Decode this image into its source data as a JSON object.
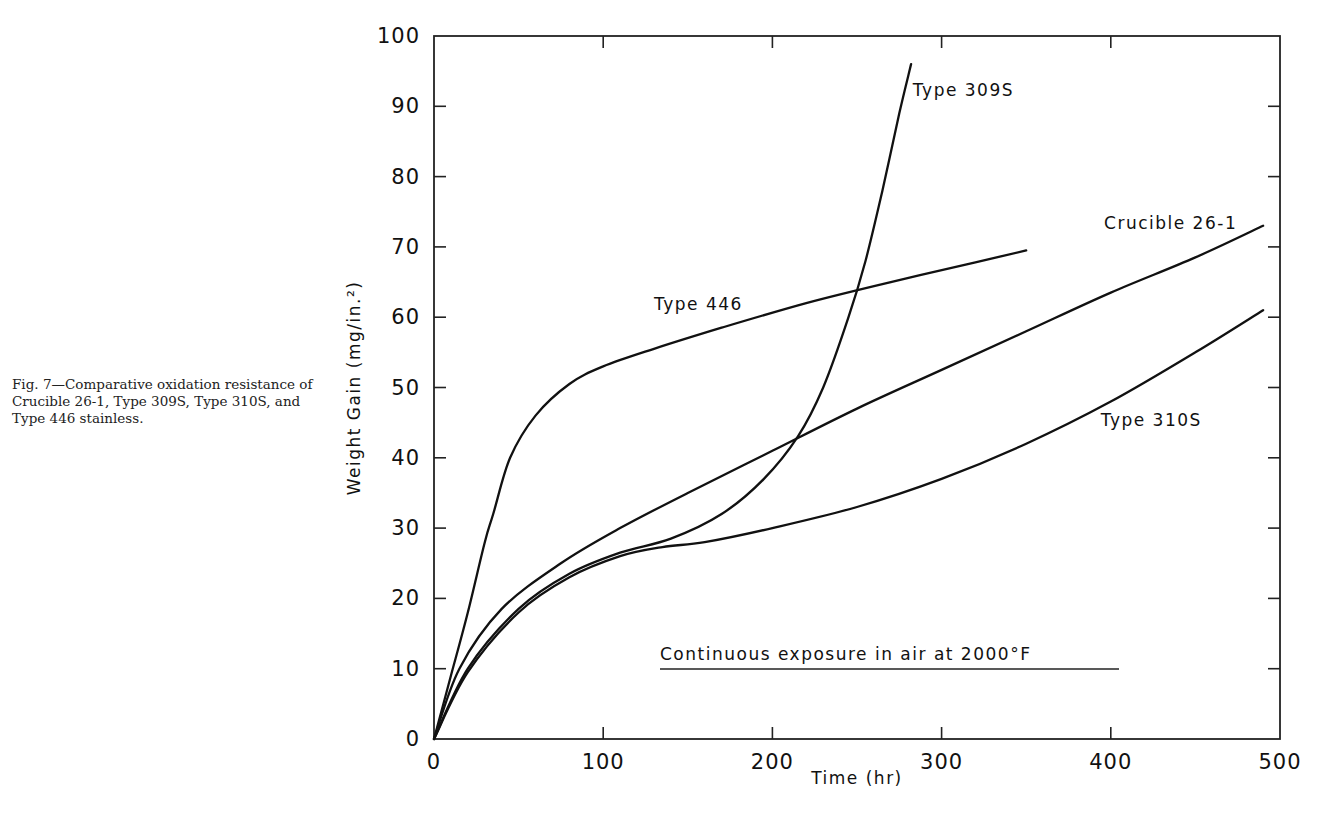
{
  "caption": "Fig. 7—Comparative oxidation resistance of Crucible 26-1, Type 309S, Type 310S, and Type 446 stainless.",
  "chart_data": {
    "type": "line",
    "title": "",
    "xlabel": "Time (hr)",
    "ylabel": "Weight Gain (mg/in.²)",
    "xlim": [
      0,
      500
    ],
    "ylim": [
      0,
      100
    ],
    "x_ticks": [
      0,
      100,
      200,
      300,
      400,
      500
    ],
    "y_ticks": [
      0,
      10,
      20,
      30,
      40,
      50,
      60,
      70,
      80,
      90,
      100
    ],
    "grid": false,
    "legend": "inline labels",
    "annotation": "Continuous exposure in air at 2000°F",
    "series": [
      {
        "name": "Type 446",
        "label_pos": [
          130,
          61
        ],
        "points": [
          [
            0,
            0
          ],
          [
            10,
            9
          ],
          [
            20,
            18
          ],
          [
            30,
            28
          ],
          [
            35,
            32
          ],
          [
            45,
            40
          ],
          [
            60,
            46
          ],
          [
            80,
            50.5
          ],
          [
            100,
            53
          ],
          [
            130,
            55.5
          ],
          [
            170,
            58.5
          ],
          [
            220,
            62
          ],
          [
            270,
            65
          ],
          [
            320,
            67.8
          ],
          [
            350,
            69.5
          ]
        ]
      },
      {
        "name": "Type 309S",
        "label_pos": [
          283,
          91.5
        ],
        "points": [
          [
            0,
            0
          ],
          [
            20,
            10
          ],
          [
            50,
            18.5
          ],
          [
            80,
            23.5
          ],
          [
            110,
            26.5
          ],
          [
            140,
            28.5
          ],
          [
            170,
            32
          ],
          [
            195,
            37
          ],
          [
            215,
            43
          ],
          [
            230,
            50
          ],
          [
            245,
            60
          ],
          [
            255,
            68
          ],
          [
            265,
            78
          ],
          [
            275,
            89
          ],
          [
            282,
            96
          ]
        ]
      },
      {
        "name": "Type 310S",
        "label_pos": [
          394,
          44.5
        ],
        "points": [
          [
            0,
            0
          ],
          [
            20,
            9.5
          ],
          [
            50,
            18
          ],
          [
            80,
            23
          ],
          [
            110,
            26
          ],
          [
            135,
            27.3
          ],
          [
            160,
            28
          ],
          [
            200,
            30
          ],
          [
            250,
            33
          ],
          [
            300,
            37
          ],
          [
            350,
            42
          ],
          [
            400,
            48
          ],
          [
            450,
            55
          ],
          [
            490,
            61
          ]
        ]
      },
      {
        "name": "Crucible 26-1",
        "label_pos": [
          396,
          72.5
        ],
        "points": [
          [
            0,
            0
          ],
          [
            15,
            10
          ],
          [
            40,
            18.5
          ],
          [
            75,
            25
          ],
          [
            110,
            30
          ],
          [
            150,
            35
          ],
          [
            200,
            41
          ],
          [
            250,
            47
          ],
          [
            300,
            52.5
          ],
          [
            350,
            58
          ],
          [
            400,
            63.5
          ],
          [
            450,
            68.5
          ],
          [
            490,
            73
          ]
        ]
      }
    ]
  }
}
